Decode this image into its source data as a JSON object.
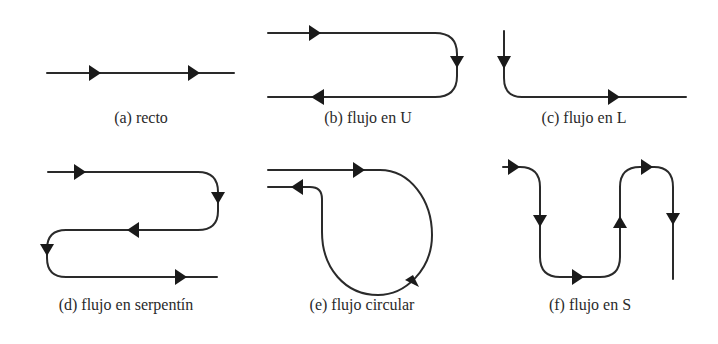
{
  "figure": {
    "panels": [
      {
        "id": "a",
        "caption": "(a) recto",
        "flow_type": "straight"
      },
      {
        "id": "b",
        "caption": "(b) flujo en U",
        "flow_type": "U-shaped"
      },
      {
        "id": "c",
        "caption": "(c) flujo en L",
        "flow_type": "L-shaped"
      },
      {
        "id": "d",
        "caption": "(d) flujo en serpentín",
        "flow_type": "serpentine"
      },
      {
        "id": "e",
        "caption": "(e) flujo circular",
        "flow_type": "circular"
      },
      {
        "id": "f",
        "caption": "(f) flujo en S",
        "flow_type": "S-shaped"
      }
    ],
    "colors": {
      "line": "#2a2a2a",
      "arrow": "#1a1a1a",
      "background": "#ffffff"
    }
  }
}
